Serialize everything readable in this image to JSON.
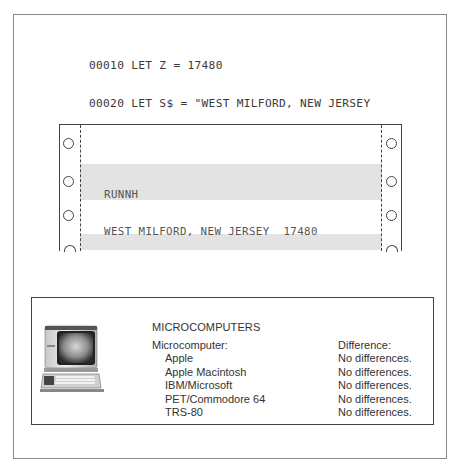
{
  "program_listing": {
    "lines": [
      "00010 LET Z = 17480",
      "00020 LET S$ = \"WEST MILFORD, NEW JERSEY",
      "00030 LET Z$ = STR$(Z)",
      "00040 PRINT S$ + Z$",
      "00999 END"
    ]
  },
  "printout": {
    "lines": [
      "RUNNH",
      "WEST MILFORD, NEW JERSEY  17480"
    ]
  },
  "compatibility": {
    "icon": "microcomputer-icon",
    "title": "MICROCOMPUTERS",
    "column_headers": {
      "computer": "Microcomputer:",
      "difference": "Difference:"
    },
    "rows": [
      {
        "computer": "Apple",
        "difference": "No differences."
      },
      {
        "computer": "Apple Macintosh",
        "difference": "No differences."
      },
      {
        "computer": "IBM/Microsoft",
        "difference": "No differences."
      },
      {
        "computer": "PET/Commodore 64",
        "difference": "No differences."
      },
      {
        "computer": "TRS-80",
        "difference": "No differences."
      }
    ]
  }
}
